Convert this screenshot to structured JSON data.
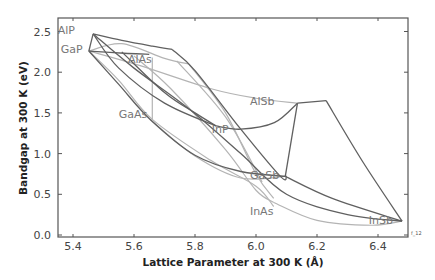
{
  "chart_data": {
    "type": "line",
    "title": "",
    "xlabel": "Lattice Parameter at 300 K (Å)",
    "ylabel": "Bandgap at 300 K (eV)",
    "xlim": [
      5.35,
      6.5
    ],
    "ylim": [
      0.0,
      2.7
    ],
    "grid": false,
    "legend": "none",
    "x_ticks": [
      "5.4",
      "5.6",
      "5.8",
      "6.0",
      "6.2",
      "6.4"
    ],
    "x_tick_values": [
      5.4,
      5.6,
      5.8,
      6.0,
      6.2,
      6.4
    ],
    "y_ticks": [
      "0.0",
      "0.5",
      "1.0",
      "1.5",
      "2.0",
      "2.5"
    ],
    "y_tick_values": [
      0.0,
      0.5,
      1.0,
      1.5,
      2.0,
      2.5
    ],
    "figure_id": "f_12",
    "materials": [
      {
        "name": "AlP",
        "a": 5.466,
        "eg": 2.47,
        "label_pos": [
          5.35,
          2.52
        ]
      },
      {
        "name": "GaP",
        "a": 5.452,
        "eg": 2.26,
        "label_pos": [
          5.36,
          2.29
        ]
      },
      {
        "name": "AlAs",
        "a": 5.66,
        "eg": 2.16,
        "label_pos": [
          5.58,
          2.16
        ]
      },
      {
        "name": "GaAs",
        "a": 5.653,
        "eg": 1.42,
        "label_pos": [
          5.55,
          1.49
        ]
      },
      {
        "name": "InP",
        "a": 5.869,
        "eg": 1.34,
        "label_pos": [
          5.855,
          1.3
        ]
      },
      {
        "name": "AlSb",
        "a": 6.136,
        "eg": 1.62,
        "label_pos": [
          5.98,
          1.65
        ]
      },
      {
        "name": "GaSb",
        "a": 6.096,
        "eg": 0.72,
        "label_pos": [
          5.98,
          0.74
        ]
      },
      {
        "name": "InAs",
        "a": 6.058,
        "eg": 0.35,
        "label_pos": [
          5.98,
          0.3
        ]
      },
      {
        "name": "InSb",
        "a": 6.479,
        "eg": 0.17,
        "label_pos": [
          6.37,
          0.19
        ]
      }
    ],
    "series": [
      {
        "name": "AlP-AlAs",
        "style": "dark",
        "points": [
          [
            5.466,
            2.47
          ],
          [
            5.56,
            2.39
          ],
          [
            5.66,
            2.32
          ],
          [
            5.725,
            2.28
          ]
        ]
      },
      {
        "name": "AlAs-AlSb",
        "style": "dark",
        "points": [
          [
            5.725,
            2.28
          ],
          [
            5.8,
            2.02
          ],
          [
            5.95,
            1.3
          ],
          [
            6.08,
            0.72
          ],
          [
            6.1,
            0.72
          ]
        ]
      },
      {
        "name": "AlP-GaP",
        "style": "dark",
        "points": [
          [
            5.466,
            2.47
          ],
          [
            5.452,
            2.26
          ]
        ]
      },
      {
        "name": "GaP-AlAs",
        "style": "dark",
        "points": [
          [
            5.452,
            2.26
          ],
          [
            5.58,
            2.23
          ],
          [
            5.65,
            2.22
          ]
        ]
      },
      {
        "name": "GaP-GaAs",
        "style": "dark",
        "points": [
          [
            5.452,
            2.26
          ],
          [
            5.55,
            1.85
          ],
          [
            5.653,
            1.42
          ],
          [
            5.8,
            0.98
          ],
          [
            5.95,
            0.78
          ],
          [
            6.1,
            0.72
          ]
        ]
      },
      {
        "name": "AlP-InP",
        "style": "dark",
        "points": [
          [
            5.466,
            2.47
          ],
          [
            5.55,
            2.05
          ],
          [
            5.7,
            1.62
          ],
          [
            5.869,
            1.34
          ]
        ]
      },
      {
        "name": "InP-AlSb",
        "style": "dark",
        "points": [
          [
            5.869,
            1.34
          ],
          [
            5.95,
            1.3
          ],
          [
            6.06,
            1.38
          ],
          [
            6.136,
            1.62
          ]
        ]
      },
      {
        "name": "AlSb-peak",
        "style": "dark",
        "points": [
          [
            6.136,
            1.62
          ],
          [
            6.23,
            1.65
          ]
        ]
      },
      {
        "name": "peak-InSb",
        "style": "dark",
        "points": [
          [
            6.23,
            1.65
          ],
          [
            6.35,
            0.9
          ],
          [
            6.479,
            0.17
          ]
        ]
      },
      {
        "name": "AlSb-GaSb",
        "style": "dark",
        "points": [
          [
            6.136,
            1.62
          ],
          [
            6.096,
            0.72
          ]
        ]
      },
      {
        "name": "GaSb-InSb",
        "style": "dark",
        "points": [
          [
            6.096,
            0.72
          ],
          [
            6.25,
            0.45
          ],
          [
            6.479,
            0.17
          ]
        ]
      },
      {
        "name": "AlP-InAs",
        "style": "dark",
        "points": [
          [
            5.466,
            2.47
          ],
          [
            5.6,
            2.05
          ],
          [
            5.78,
            1.55
          ],
          [
            5.95,
            1.0
          ],
          [
            6.1,
            0.5
          ],
          [
            6.3,
            0.25
          ],
          [
            6.479,
            0.17
          ]
        ]
      },
      {
        "name": "AlAs-InP",
        "style": "dark",
        "points": [
          [
            5.56,
            2.25
          ],
          [
            5.7,
            1.75
          ],
          [
            5.8,
            1.5
          ],
          [
            5.869,
            1.34
          ]
        ]
      },
      {
        "name": "GaP-InP-l",
        "style": "light",
        "points": [
          [
            5.452,
            2.26
          ],
          [
            5.56,
            2.35
          ],
          [
            5.7,
            2.17
          ],
          [
            5.78,
            2.1
          ]
        ]
      },
      {
        "name": "AlAs-GaAs-l",
        "style": "light",
        "points": [
          [
            5.66,
            2.18
          ],
          [
            5.66,
            1.42
          ]
        ]
      },
      {
        "name": "GaP-AlSb-l",
        "style": "light",
        "points": [
          [
            5.452,
            2.26
          ],
          [
            5.62,
            2.08
          ],
          [
            5.85,
            1.8
          ],
          [
            6.0,
            1.68
          ],
          [
            6.136,
            1.62
          ]
        ]
      },
      {
        "name": "GaP-InAs-l",
        "style": "light",
        "points": [
          [
            5.452,
            2.26
          ],
          [
            5.55,
            1.9
          ],
          [
            5.66,
            1.42
          ],
          [
            5.85,
            0.92
          ],
          [
            6.0,
            0.6
          ],
          [
            6.058,
            0.35
          ]
        ]
      },
      {
        "name": "AlAs-InAs-l",
        "style": "light",
        "points": [
          [
            5.6,
            2.2
          ],
          [
            5.72,
            1.8
          ],
          [
            5.9,
            1.05
          ],
          [
            6.0,
            0.55
          ],
          [
            6.058,
            0.4
          ]
        ]
      },
      {
        "name": "InAs-InSb-l",
        "style": "light",
        "points": [
          [
            6.058,
            0.4
          ],
          [
            6.2,
            0.18
          ],
          [
            6.38,
            0.12
          ],
          [
            6.479,
            0.17
          ]
        ]
      },
      {
        "name": "GaAs-GaSb-l",
        "style": "light",
        "points": [
          [
            5.653,
            1.42
          ],
          [
            5.8,
            0.97
          ],
          [
            5.95,
            0.7
          ],
          [
            6.096,
            0.72
          ]
        ]
      },
      {
        "name": "InP-InAs-l",
        "style": "light",
        "points": [
          [
            5.78,
            2.1
          ],
          [
            5.9,
            1.5
          ],
          [
            6.0,
            0.75
          ],
          [
            6.058,
            0.45
          ]
        ]
      },
      {
        "name": "InP-band-l",
        "style": "light",
        "points": [
          [
            5.74,
            2.14
          ],
          [
            5.9,
            1.45
          ],
          [
            6.02,
            0.65
          ]
        ]
      }
    ]
  }
}
